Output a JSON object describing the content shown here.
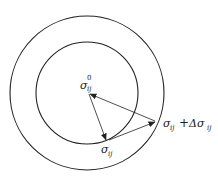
{
  "diagram": {
    "type": "concentric-circles-stress-vectors",
    "colors": {
      "stroke": "#222222",
      "background": "#ffffff"
    },
    "circles": [
      {
        "name": "outer-yield-surface",
        "cx": 87,
        "cy": 93,
        "r": 77
      },
      {
        "name": "inner-yield-surface",
        "cx": 87,
        "cy": 93,
        "r": 51
      }
    ],
    "labels": {
      "center": {
        "base": "σ",
        "sup": "0",
        "sub": "ij"
      },
      "inner_point": {
        "base": "σ",
        "sub": "ij"
      },
      "outer_point": {
        "base": "σ",
        "sub": "ij",
        "plus": "+",
        "delta": "Δσ",
        "delta_sub": "ij"
      }
    }
  }
}
